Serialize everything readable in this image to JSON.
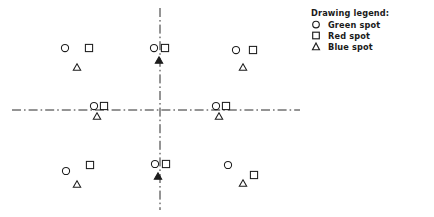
{
  "figure": {
    "kind": "engineering-drawing",
    "background": "#ffffff",
    "ink_color": "#1d1d1d",
    "centerline_color": "#2b2b2b",
    "width": 434,
    "height": 217
  },
  "legend": {
    "title": "Drawing legend:",
    "entries": [
      {
        "symbol": "circle",
        "label": "Green spot",
        "color": "#1d1d1d"
      },
      {
        "symbol": "square",
        "label": "Red spot",
        "color": "#1d1d1d"
      },
      {
        "symbol": "triangle",
        "label": "Blue spot",
        "color": "#1d1d1d"
      }
    ]
  },
  "centerlines": {
    "style": "dash-dot",
    "horizontal": {
      "x1": 12,
      "x2": 300,
      "y": 110
    },
    "vertical": {
      "x": 160,
      "y1": 8,
      "y2": 210
    }
  },
  "clusters": [
    {
      "name": "top-left",
      "circle": {
        "x": 65,
        "y": 48
      },
      "square": {
        "x": 89,
        "y": 48
      },
      "triangle": {
        "x": 77,
        "y": 67,
        "filled": false
      }
    },
    {
      "name": "top-center",
      "circle": {
        "x": 154,
        "y": 48
      },
      "square": {
        "x": 165,
        "y": 48
      },
      "triangle": {
        "x": 159,
        "y": 60,
        "filled": true
      }
    },
    {
      "name": "top-right",
      "circle": {
        "x": 236,
        "y": 50
      },
      "square": {
        "x": 253,
        "y": 50
      },
      "triangle": {
        "x": 243,
        "y": 67,
        "filled": false
      }
    },
    {
      "name": "middle-left",
      "circle": {
        "x": 94,
        "y": 106
      },
      "square": {
        "x": 104,
        "y": 106
      },
      "triangle": {
        "x": 97,
        "y": 116,
        "filled": false
      }
    },
    {
      "name": "middle-right",
      "circle": {
        "x": 216,
        "y": 106
      },
      "square": {
        "x": 226,
        "y": 106
      },
      "triangle": {
        "x": 219,
        "y": 116,
        "filled": false
      }
    },
    {
      "name": "bottom-left",
      "circle": {
        "x": 66,
        "y": 171
      },
      "square": {
        "x": 90,
        "y": 165
      },
      "triangle": {
        "x": 77,
        "y": 184,
        "filled": false
      }
    },
    {
      "name": "bottom-center",
      "circle": {
        "x": 155,
        "y": 164
      },
      "square": {
        "x": 166,
        "y": 164
      },
      "triangle": {
        "x": 158,
        "y": 176,
        "filled": true
      }
    },
    {
      "name": "bottom-right",
      "circle": {
        "x": 228,
        "y": 165
      },
      "square": {
        "x": 254,
        "y": 175
      },
      "triangle": {
        "x": 243,
        "y": 183,
        "filled": false
      }
    }
  ],
  "marker_sizes": {
    "circle_radius": 3.6,
    "square_side": 7.2,
    "triangle_width": 7.4,
    "triangle_height": 6.6,
    "stroke_width": 1.05
  }
}
